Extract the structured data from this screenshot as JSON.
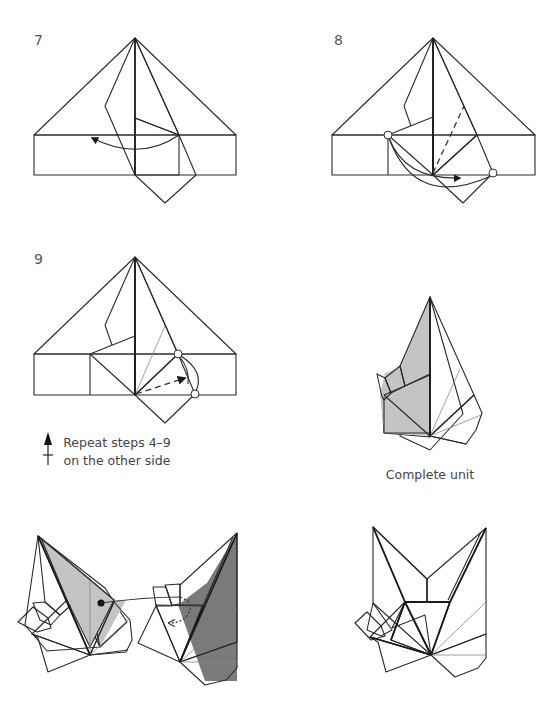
{
  "steps": [
    {
      "number": "7",
      "caption": ""
    },
    {
      "number": "8",
      "caption": ""
    },
    {
      "number": "9",
      "caption": ""
    },
    {
      "number": "",
      "caption": "Complete unit"
    }
  ],
  "repeat_note": {
    "line1": "Repeat steps 4–9",
    "line2": "on the other side",
    "icon": "turn-over-arrow-icon"
  },
  "colors": {
    "paper_light": "#c4c4c4",
    "paper_dark": "#7a7a7a",
    "paper_white": "#ffffff",
    "line": "#2a2a2a"
  },
  "assembly": {
    "icons": [
      "insert-dot-icon",
      "tuck-arrow-icon"
    ]
  }
}
